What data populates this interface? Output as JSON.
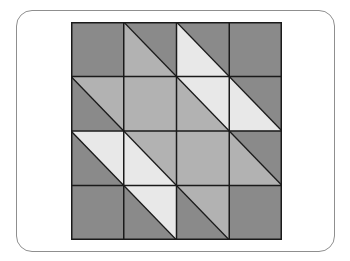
{
  "figure": {
    "type": "quilt-block-pattern",
    "grid": {
      "rows": 4,
      "cols": 4
    },
    "colors": {
      "dark": "#8a8a8a",
      "medium": "#b2b2b2",
      "light": "#e8e8e8",
      "line": "#1a1a1a",
      "frame": "#8f8f8f"
    },
    "diagonal_direction": "top-left-to-bottom-right",
    "cells": [
      [
        {
          "type": "solid",
          "fill": "dark"
        },
        {
          "type": "split",
          "upper_right": "dark",
          "lower_left": "medium"
        },
        {
          "type": "split",
          "upper_right": "dark",
          "lower_left": "light"
        },
        {
          "type": "solid",
          "fill": "dark"
        }
      ],
      [
        {
          "type": "split",
          "upper_right": "medium",
          "lower_left": "dark"
        },
        {
          "type": "solid",
          "fill": "medium"
        },
        {
          "type": "split",
          "upper_right": "light",
          "lower_left": "medium"
        },
        {
          "type": "split",
          "upper_right": "dark",
          "lower_left": "light"
        }
      ],
      [
        {
          "type": "split",
          "upper_right": "light",
          "lower_left": "dark"
        },
        {
          "type": "split",
          "upper_right": "medium",
          "lower_left": "light"
        },
        {
          "type": "solid",
          "fill": "medium"
        },
        {
          "type": "split",
          "upper_right": "dark",
          "lower_left": "medium"
        }
      ],
      [
        {
          "type": "solid",
          "fill": "dark"
        },
        {
          "type": "split",
          "upper_right": "light",
          "lower_left": "dark"
        },
        {
          "type": "split",
          "upper_right": "medium",
          "lower_left": "dark"
        },
        {
          "type": "solid",
          "fill": "dark"
        }
      ]
    ]
  }
}
